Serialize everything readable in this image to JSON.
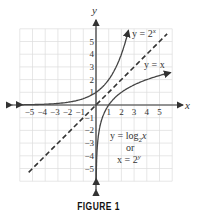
{
  "chart_data": {
    "type": "line",
    "title": "",
    "xlabel": "x",
    "ylabel": "y",
    "xlim": [
      -6,
      6
    ],
    "ylim": [
      -6,
      6
    ],
    "grid": true,
    "x_ticks": [
      "-5",
      "-4",
      "-3",
      "-2",
      "-1",
      "1",
      "2",
      "3",
      "4",
      "5"
    ],
    "y_ticks": [
      "5",
      "4",
      "3",
      "2",
      "1",
      "-1",
      "-2",
      "-3",
      "-4",
      "-5"
    ],
    "series": [
      {
        "name": "y = 2^x",
        "style": "solid",
        "x": [
          -5.8,
          -4,
          -3,
          -2,
          -1,
          0,
          1,
          2,
          2.5
        ],
        "y": [
          0.018,
          0.0625,
          0.125,
          0.25,
          0.5,
          1,
          2,
          4,
          5.66
        ]
      },
      {
        "name": "y = x",
        "style": "dashed",
        "x": [
          -6,
          6
        ],
        "y": [
          -6,
          6
        ]
      },
      {
        "name": "y = log_2 x  or  x = 2^y",
        "style": "solid",
        "x": [
          0.018,
          0.0625,
          0.125,
          0.25,
          0.5,
          1,
          2,
          4,
          5.66
        ],
        "y": [
          -5.8,
          -4,
          -3,
          -2,
          -1,
          0,
          1,
          2,
          2.5
        ]
      }
    ],
    "annotations": [
      "y = 2^x",
      "y = x",
      "y = log2 x",
      "or",
      "x = 2^y"
    ]
  },
  "labels": {
    "x_axis": "x",
    "y_axis": "y",
    "exp_curve": "y = 2",
    "exp_sup": "x",
    "identity": "y = x",
    "log_curve": "y = log",
    "log_sub": "2",
    "log_var": "x",
    "or": "or",
    "inverse": "x = 2",
    "inverse_sup": "y"
  },
  "caption": "FIGURE 1"
}
